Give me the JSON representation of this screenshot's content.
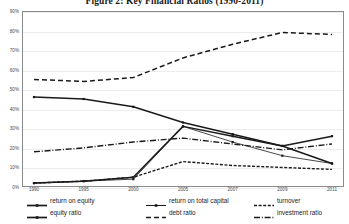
{
  "figure": {
    "title": "Figure 2: Key Financial Ratios (1990-2011)"
  },
  "axis": {
    "y_ticks": [
      "0%",
      "10%",
      "20%",
      "30%",
      "40%",
      "50%",
      "60%",
      "70%",
      "80%",
      "90%"
    ],
    "x_ticks": [
      "1990",
      "1995",
      "2000",
      "2005",
      "2007",
      "2009",
      "2011"
    ]
  },
  "legend": {
    "items": [
      {
        "label": "return on equity",
        "key": "solid-marker",
        "row": 1,
        "x": 26
      },
      {
        "label": "return on total capital",
        "key": "thin-marker",
        "row": 1,
        "x": 145
      },
      {
        "label": "turnover",
        "key": "short-dash",
        "row": 1,
        "x": 253
      },
      {
        "label": "equity ratio",
        "key": "solid-marker",
        "row": 2,
        "x": 26
      },
      {
        "label": "debt ratio",
        "key": "long-dash",
        "row": 2,
        "x": 145
      },
      {
        "label": "investment ratio",
        "key": "dash-dot",
        "row": 2,
        "x": 253
      }
    ]
  },
  "colors": {
    "line": "#1a1a1a",
    "grid": "#ededed",
    "frame": "#8a8a8a",
    "text": "#4a4a4a"
  },
  "chart_data": {
    "type": "line",
    "title": "Figure 2: Key Financial Ratios (1990-2011)",
    "xlabel": "",
    "ylabel": "",
    "categories": [
      "1990",
      "1995",
      "2000",
      "2005",
      "2007",
      "2009",
      "2011"
    ],
    "ylim": [
      0,
      90
    ],
    "y_tick_step": 10,
    "grid": true,
    "legend_position": "bottom",
    "series": [
      {
        "name": "return on equity",
        "style": "solid-marker",
        "values": [
          2,
          3,
          5,
          31,
          26,
          21,
          26
        ]
      },
      {
        "name": "return on total capital",
        "style": "thin-marker",
        "values": [
          2,
          3,
          4,
          31,
          23,
          16,
          12
        ]
      },
      {
        "name": "turnover",
        "style": "short-dash",
        "values": [
          2,
          3,
          5,
          13,
          11,
          10,
          9
        ]
      },
      {
        "name": "equity ratio",
        "style": "solid-marker",
        "values": [
          46,
          45,
          41,
          33,
          27,
          21,
          12
        ]
      },
      {
        "name": "debt ratio",
        "style": "long-dash",
        "values": [
          55,
          54,
          56,
          66,
          73,
          79,
          78
        ]
      },
      {
        "name": "investment ratio",
        "style": "dash-dot",
        "values": [
          18,
          20,
          23,
          25,
          22,
          19,
          22
        ]
      }
    ]
  }
}
